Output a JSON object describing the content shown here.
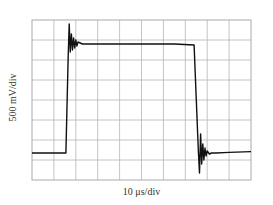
{
  "chart_data": {
    "type": "line",
    "title": "",
    "xlabel": "10 μs/div",
    "ylabel": "500 mV/div",
    "grid": true,
    "divisions": {
      "x": 10,
      "y": 8
    },
    "x_units_per_div": "10 μs",
    "y_units_per_div": "500 mV",
    "xlim_div": [
      0,
      10
    ],
    "ylim_div": [
      0,
      8
    ],
    "series": [
      {
        "name": "pulse",
        "description": "Square pulse: baseline ~1.35 div, rising edge at ~1.6 div with overshoot ringing (peak ~7.8 div), settles at ~6.8 div, falling edge at ~7.5 div with undershoot ringing (min ~0.35 div), settles back to baseline ~1.35 div",
        "x_div": [
          0,
          1.55,
          1.65,
          1.7,
          1.75,
          1.8,
          1.85,
          1.9,
          1.95,
          2.0,
          2.05,
          2.1,
          2.2,
          2.3,
          2.5,
          3.0,
          6.5,
          7.4,
          7.5,
          7.6,
          7.65,
          7.7,
          7.75,
          7.8,
          7.85,
          7.9,
          7.95,
          8.0,
          8.1,
          8.2,
          8.4,
          9.0,
          10
        ],
        "y_div": [
          1.35,
          1.35,
          6.0,
          7.8,
          6.4,
          7.3,
          6.5,
          7.1,
          6.6,
          7.0,
          6.7,
          6.9,
          6.85,
          6.8,
          6.8,
          6.8,
          6.8,
          6.75,
          4.0,
          1.4,
          0.35,
          2.3,
          0.8,
          1.8,
          1.0,
          1.6,
          1.2,
          1.45,
          1.3,
          1.35,
          1.35,
          1.38,
          1.42
        ]
      }
    ]
  }
}
